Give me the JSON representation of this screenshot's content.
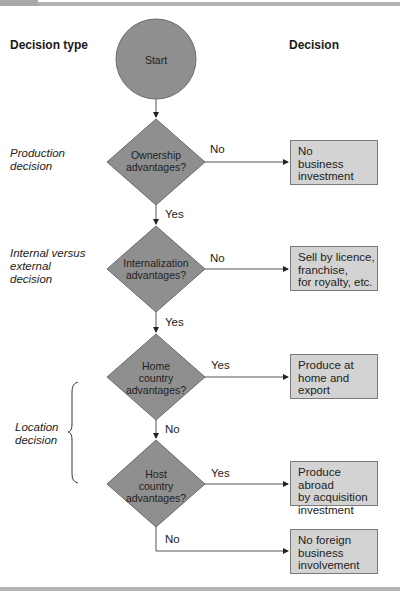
{
  "headers": {
    "decision_type": "Decision type",
    "decision": "Decision"
  },
  "decision_types": [
    {
      "label": "Production\ndecision"
    },
    {
      "label": "Internal versus\nexternal\ndecision"
    },
    {
      "label": "Location\ndecision"
    }
  ],
  "start": {
    "label": "Start"
  },
  "questions": [
    {
      "label": "Ownership\nadvantages?"
    },
    {
      "label": "Internalization\nadvantages?"
    },
    {
      "label": "Home\ncountry\nadvantages?"
    },
    {
      "label": "Host\ncountry\nadvantages?"
    }
  ],
  "edges": {
    "q1_right": "No",
    "q1_down": "Yes",
    "q2_right": "No",
    "q2_down": "Yes",
    "q3_right": "Yes",
    "q3_down": "No",
    "q4_right": "Yes",
    "q4_down": "No"
  },
  "outcomes": [
    {
      "label": "No\nbusiness\ninvestment"
    },
    {
      "label": "Sell by licence,\nfranchise,\nfor royalty, etc."
    },
    {
      "label": "Produce at\nhome and\nexport"
    },
    {
      "label": "Produce abroad\nby acquisition\ninvestment"
    },
    {
      "label": "No foreign\nbusiness\ninvolvement"
    }
  ],
  "colors": {
    "shape_fill": "#8f8f8f",
    "shape_stroke": "#6a6a6a",
    "box_fill": "#d3d3d3",
    "line": "#555555"
  }
}
